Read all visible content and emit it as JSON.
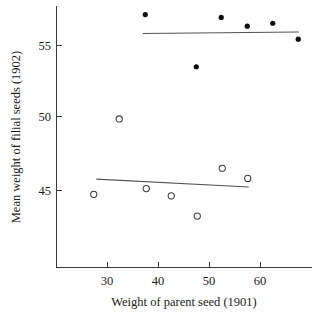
{
  "chart_data": {
    "type": "scatter",
    "title": "",
    "xlabel": "Weight of parent seed (1901)",
    "ylabel": "Mean weight of filial seeds (1902)",
    "xlim": [
      23,
      70
    ],
    "ylim": [
      41.5,
      58.0
    ],
    "xticks": [
      30,
      40,
      50,
      60
    ],
    "yticks": [
      45,
      50,
      55
    ],
    "xtick_labels": [
      "30",
      "40",
      "50",
      "60"
    ],
    "ytick_labels": [
      "45",
      "50",
      "55"
    ],
    "grid": false,
    "legend": "none",
    "series": [
      {
        "name": "filled-points",
        "marker": "filled-circle",
        "color": "#0d0d0d",
        "points": [
          {
            "x": 37.5,
            "y": 57.1
          },
          {
            "x": 47.5,
            "y": 53.5
          },
          {
            "x": 52.4,
            "y": 56.9
          },
          {
            "x": 57.5,
            "y": 56.3
          },
          {
            "x": 62.5,
            "y": 56.5
          },
          {
            "x": 67.5,
            "y": 55.4
          }
        ]
      },
      {
        "name": "open-points",
        "marker": "open-circle",
        "color": "#3b3b3b",
        "points": [
          {
            "x": 27.4,
            "y": 44.7
          },
          {
            "x": 32.4,
            "y": 49.9
          },
          {
            "x": 37.7,
            "y": 45.1
          },
          {
            "x": 42.6,
            "y": 44.6
          },
          {
            "x": 47.7,
            "y": 43.2
          },
          {
            "x": 52.6,
            "y": 46.5
          },
          {
            "x": 57.6,
            "y": 45.8
          }
        ]
      }
    ],
    "fit_lines": [
      {
        "name": "upper-regression-line",
        "color": "#555555",
        "x0": 37.0,
        "y0": 55.8,
        "x1": 67.6,
        "y1": 55.9
      },
      {
        "name": "lower-regression-line",
        "color": "#555555",
        "x0": 27.9,
        "y0": 45.75,
        "x1": 57.8,
        "y1": 45.2
      }
    ]
  },
  "axes": {
    "y_title": "Mean weight of filial seeds (1902)",
    "x_title": "Weight of parent seed (1901)",
    "y_tick_45": "45",
    "y_tick_50": "50",
    "y_tick_55": "55",
    "x_tick_30": "30",
    "x_tick_40": "40",
    "x_tick_50": "50",
    "x_tick_60": "60"
  }
}
